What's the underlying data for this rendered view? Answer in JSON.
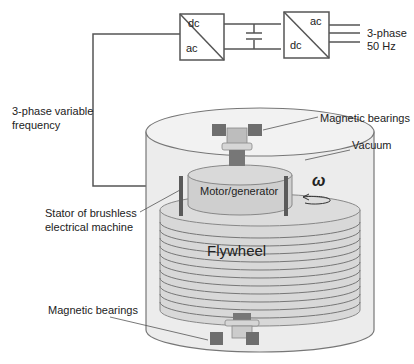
{
  "converters": {
    "left": {
      "top": "dc",
      "bottom": "ac"
    },
    "right": {
      "top": "ac",
      "bottom": "dc"
    }
  },
  "grid_output": {
    "line1": "3-phase",
    "line2": "50 Hz"
  },
  "variable_freq": {
    "line1": "3-phase variable",
    "line2": "frequency"
  },
  "labels": {
    "magnetic_bearings_top": "Magnetic bearings",
    "vacuum": "Vacuum",
    "motor_generator": "Motor/generator",
    "omega": "ω",
    "stator_line1": "Stator of brushless",
    "stator_line2": "electrical machine",
    "flywheel": "Flywheel",
    "magnetic_bearings_bottom": "Magnetic bearings"
  },
  "colors": {
    "line": "#555555",
    "vessel_fill": "#ebebeb",
    "motor_fill": "#cfcfcf",
    "flywheel_fill": "#d6d6d6",
    "bearing": "#6e6e6e",
    "stator": "#5a5a5a"
  }
}
